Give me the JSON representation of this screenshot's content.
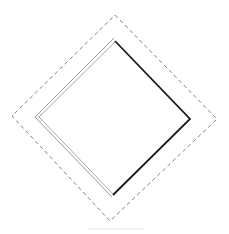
{
  "diagram": {
    "outer_diamond": {
      "style": "dashed",
      "color": "#8a7f80",
      "points": [
        [
          115,
          15
        ],
        [
          217,
          119
        ],
        [
          110,
          221
        ],
        [
          12,
          116
        ]
      ]
    },
    "inner_diamond": {
      "left_edges": {
        "style": "double",
        "color": "#9a9a9a",
        "points": [
          [
            113,
            195
          ],
          [
            37,
            117
          ],
          [
            115,
            41
          ]
        ]
      },
      "right_edges": {
        "style": "solid",
        "color": "#1a1a1a",
        "points": [
          [
            115,
            41
          ],
          [
            190,
            119
          ],
          [
            113,
            195
          ]
        ]
      }
    }
  }
}
